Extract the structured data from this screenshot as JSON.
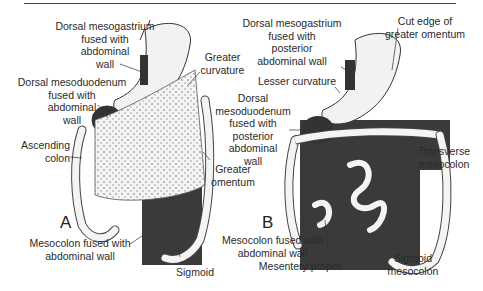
{
  "figure": {
    "panels": [
      {
        "id": "A",
        "letter": "A",
        "labels": {
          "dorsal_mesogastrium": "Dorsal mesogastrium\nfused with\nabdominal\nwall",
          "greater_curvature": "Greater\ncurvature",
          "dorsal_mesoduodenum": "Dorsal mesoduodenum\nfused with\nabdominal\nwall",
          "ascending_colon": "Ascending\ncolon",
          "greater_omentum": "Greater\nomentum",
          "mesocolon": "Mesocolon fused with\nabdominal wall",
          "sigmoid": "Sigmoid"
        }
      },
      {
        "id": "B",
        "letter": "B",
        "labels": {
          "dorsal_mesogastrium": "Dorsal mesogastrium\nfused with\nposterior\nabdominal wall",
          "cut_edge": "Cut edge of\ngreater omentum",
          "lesser_curvature": "Lesser curvature",
          "dorsal_mesoduodenum": "Dorsal\nmesoduodenum\nfused with\nposterior\nabdominal\nwall",
          "transverse_mesocolon": "Transverse\nmesocolon",
          "mesocolon": "Mesocolon fused with\nabdominal wall",
          "mesentery_proper": "Mesentery proper",
          "sigmoid_mesocolon": "Sigmoid\nmesocolon"
        }
      }
    ]
  }
}
